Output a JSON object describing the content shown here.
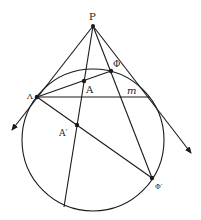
{
  "diagram": {
    "type": "projective-geometry-figure",
    "colors": {
      "stroke": "#1a1a1a",
      "label": "#222222",
      "background": "#ffffff"
    },
    "labels": {
      "P": "P",
      "Lambda": "Λ",
      "A": "A",
      "Phi": "Φ",
      "m": "m",
      "A_prime": "A′",
      "Phi_prime": "Φ′"
    },
    "points": {
      "P": [
        93,
        26
      ],
      "Lambda": [
        37,
        97
      ],
      "A": [
        84,
        81
      ],
      "Phi": [
        111,
        71
      ],
      "A_prime": [
        77,
        125
      ],
      "Phi_prime": [
        152,
        178
      ]
    },
    "circle": {
      "cx": 93,
      "cy": 140,
      "r": 71
    }
  }
}
